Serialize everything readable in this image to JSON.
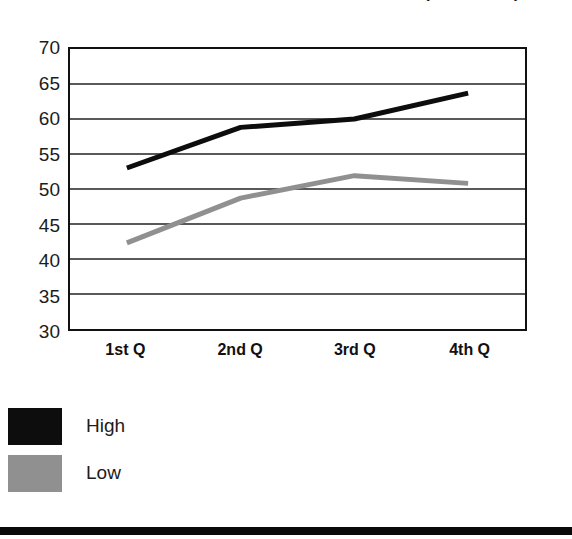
{
  "chart_data": {
    "type": "line",
    "title": "(continued)",
    "subtitle": "",
    "xlabel": "",
    "ylabel": "",
    "categories": [
      "1st Q",
      "2nd Q",
      "3rd Q",
      "4th Q"
    ],
    "series": [
      {
        "name": "High",
        "color": "#0d0d0d",
        "values": [
          53.0,
          58.8,
          60.0,
          63.7
        ]
      },
      {
        "name": "Low",
        "color": "#909090",
        "values": [
          42.3,
          48.7,
          51.9,
          50.8
        ]
      }
    ],
    "ylim": [
      30,
      70
    ],
    "yticks": [
      70,
      65,
      60,
      55,
      50,
      45,
      40,
      35,
      30
    ],
    "ytick_labels": [
      "70",
      "65",
      "60",
      "55",
      "50",
      "45",
      "40",
      "35",
      "30"
    ],
    "grid": true,
    "grid_axis": "y",
    "legend_position": "below-left",
    "legend_entries": [
      {
        "label": "High",
        "swatch": "#0d0d0d"
      },
      {
        "label": "Low",
        "swatch": "#909090"
      }
    ],
    "line_width_high": 5,
    "line_width_low": 5,
    "markers": false,
    "frame": true,
    "frame_color": "#111111",
    "background": "#ffffff"
  },
  "figure": {
    "bottom_rule_color": "#0a0a0a"
  }
}
